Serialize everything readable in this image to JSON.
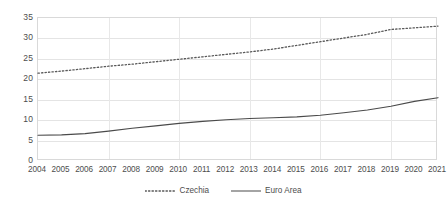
{
  "chart_data": {
    "type": "line",
    "title": "",
    "xlabel": "",
    "ylabel": "",
    "ylim": [
      0,
      35
    ],
    "yticks": [
      0,
      5,
      10,
      15,
      20,
      25,
      30,
      35
    ],
    "grid": true,
    "legend_position": "bottom",
    "categories": [
      "2004",
      "2005",
      "2006",
      "2007",
      "2008",
      "2009",
      "2010",
      "2011",
      "2012",
      "2013",
      "2014",
      "2015",
      "2016",
      "2017",
      "2018",
      "2019",
      "2020",
      "2021"
    ],
    "series": [
      {
        "name": "Czechia",
        "style": "dotted",
        "color": "#595959",
        "values": [
          21.5,
          22.0,
          22.6,
          23.2,
          23.7,
          24.3,
          24.9,
          25.5,
          26.1,
          26.7,
          27.4,
          28.3,
          29.2,
          30.1,
          31.0,
          32.2,
          32.6,
          33.0
        ]
      },
      {
        "name": "Euro Area",
        "style": "solid",
        "color": "#4a4a4a",
        "values": [
          6.3,
          6.4,
          6.7,
          7.3,
          8.0,
          8.6,
          9.2,
          9.7,
          10.1,
          10.4,
          10.6,
          10.8,
          11.2,
          11.8,
          12.5,
          13.4,
          14.6,
          15.5
        ]
      }
    ]
  },
  "legend": {
    "items": [
      {
        "label": "Czechia",
        "icon": "dotted-line-swatch"
      },
      {
        "label": "Euro Area",
        "icon": "solid-line-swatch"
      }
    ]
  },
  "colors": {
    "czechia": "#595959",
    "euro_area": "#4a4a4a",
    "gridline": "#e4e4e4",
    "border": "#d9d9d9",
    "text": "#4d4d4d",
    "background": "#ffffff"
  }
}
